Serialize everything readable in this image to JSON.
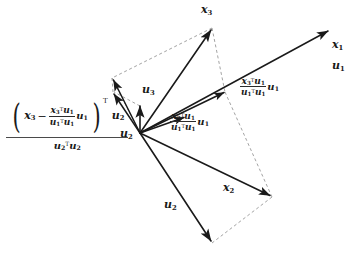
{
  "diagram": {
    "background": "#ffffff",
    "stroke_solid": "#1a1a1a",
    "stroke_dashed": "#8c8c8c",
    "origin": {
      "x": 140,
      "y": 133
    }
  },
  "labels": {
    "x1": {
      "base": "x",
      "sub": "1"
    },
    "u1": {
      "base": "u",
      "sub": "1"
    },
    "x2": {
      "base": "x",
      "sub": "2"
    },
    "u2": {
      "base": "u",
      "sub": "2"
    },
    "x3": {
      "base": "x",
      "sub": "3"
    },
    "u3": {
      "base": "u",
      "sub": "3"
    }
  },
  "formulas": {
    "proj_x3_on_u1": {
      "numerator": {
        "vec": "x",
        "vec_sub": "3",
        "transpose": "T",
        "times": "u",
        "times_sub": "1"
      },
      "denominator": {
        "vec": "u",
        "vec_sub": "1",
        "transpose": "T",
        "times": "u",
        "times_sub": "1"
      },
      "trailing": {
        "base": "u",
        "sub": "1"
      },
      "plain": "(x3^T u1)/(u1^T u1) u1"
    },
    "proj_x2_on_u1": {
      "numerator": {
        "vec": "x",
        "vec_sub": "2",
        "transpose": "T",
        "times": "u",
        "times_sub": "1"
      },
      "denominator": {
        "vec": "u",
        "vec_sub": "1",
        "transpose": "T",
        "times": "u",
        "times_sub": "1"
      },
      "trailing": {
        "base": "u",
        "sub": "1"
      },
      "plain": "(x2^T u1)/(u1^T u1) u1"
    },
    "proj_residual_on_u2": {
      "open_paren": "(",
      "close_paren": ")",
      "inner_vec": {
        "base": "x",
        "sub": "3"
      },
      "minus": "−",
      "inner_frac_num": {
        "vec": "x",
        "vec_sub": "3",
        "transpose": "T",
        "times": "u",
        "times_sub": "1"
      },
      "inner_frac_den": {
        "vec": "u",
        "vec_sub": "1",
        "transpose": "T",
        "times": "u",
        "times_sub": "1"
      },
      "inner_trailing": {
        "base": "u",
        "sub": "1"
      },
      "paren_transpose": "T",
      "dotted_with": {
        "base": "u",
        "sub": "2"
      },
      "denominator": {
        "vec": "u",
        "vec_sub": "2",
        "transpose": "T",
        "times": "u",
        "times_sub": "2"
      },
      "trailing": {
        "base": "u",
        "sub": "2"
      },
      "plain": "((x3 - (x3^T u1)/(u1^T u1) u1)^T u2)/(u2^T u2) u2"
    }
  },
  "vectors": [
    {
      "name": "x1-u1-vector",
      "from": [
        140,
        133
      ],
      "to": [
        330,
        30
      ],
      "style": "solid",
      "label": "x1/u1"
    },
    {
      "name": "x3-vector",
      "from": [
        140,
        133
      ],
      "to": [
        212,
        28
      ],
      "style": "solid",
      "label": "x3"
    },
    {
      "name": "x2-vector",
      "from": [
        140,
        133
      ],
      "to": [
        272,
        197
      ],
      "style": "solid",
      "label": "x2"
    },
    {
      "name": "u2-vector",
      "from": [
        140,
        133
      ],
      "to": [
        212,
        243
      ],
      "style": "solid",
      "label": "u2"
    },
    {
      "name": "u3-vector",
      "from": [
        140,
        133
      ],
      "to": [
        140,
        104
      ],
      "style": "solid",
      "label": "u3"
    },
    {
      "name": "residual-upper-vector",
      "from": [
        140,
        133
      ],
      "to": [
        112,
        78
      ],
      "style": "solid",
      "label": ""
    },
    {
      "name": "residual-lower-vector",
      "from": [
        140,
        133
      ],
      "to": [
        112,
        92
      ],
      "style": "solid",
      "label": ""
    },
    {
      "name": "proj-x3-u1-vector",
      "from": [
        140,
        133
      ],
      "to": [
        225,
        92
      ],
      "style": "solid",
      "label": "proj_x3_on_u1"
    },
    {
      "name": "proj-x2-u1-vector",
      "from": [
        140,
        133
      ],
      "to": [
        185,
        117
      ],
      "style": "solid",
      "label": "proj_x2_on_u1"
    }
  ],
  "guides": [
    {
      "name": "guide-x3-to-proj",
      "from": [
        212,
        28
      ],
      "to": [
        225,
        92
      ]
    },
    {
      "name": "guide-x3-to-residual",
      "from": [
        212,
        28
      ],
      "to": [
        112,
        78
      ]
    },
    {
      "name": "guide-residual-to-origin-top",
      "from": [
        112,
        78
      ],
      "to": [
        140,
        133
      ]
    },
    {
      "name": "guide-proj-to-x2tip",
      "from": [
        225,
        92
      ],
      "to": [
        272,
        197
      ]
    },
    {
      "name": "guide-x2tip-to-u2tip",
      "from": [
        272,
        197
      ],
      "to": [
        212,
        243
      ]
    },
    {
      "name": "guide-residual-pair",
      "from": [
        112,
        78
      ],
      "to": [
        112,
        92
      ]
    },
    {
      "name": "guide-u3-to-residual",
      "from": [
        140,
        104
      ],
      "to": [
        112,
        92
      ]
    }
  ]
}
